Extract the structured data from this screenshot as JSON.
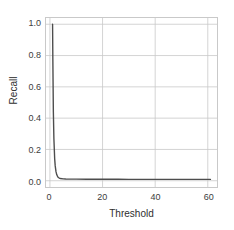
{
  "chart_data": {
    "type": "line",
    "title": "",
    "xlabel": "Threshold",
    "ylabel": "Recall",
    "xlim": [
      -1.5,
      63.5
    ],
    "ylim": [
      -0.04,
      1.04
    ],
    "xticks": [
      0,
      20,
      40,
      60
    ],
    "xtick_labels": [
      "0",
      "20",
      "40",
      "60"
    ],
    "yticks": [
      0.0,
      0.2,
      0.4,
      0.6,
      0.8,
      1.0
    ],
    "ytick_labels": [
      "0.0",
      "0.2",
      "0.4",
      "0.6",
      "0.8",
      "1.0"
    ],
    "grid": true,
    "legend": false,
    "line_color": "#4d4d4d",
    "grid_color": "#c9c9c9",
    "frame_color": "#c9c9c9",
    "series": [
      {
        "name": "Recall",
        "x": [
          1.0,
          1.1,
          1.3,
          1.5,
          1.8,
          2.0,
          2.3,
          2.6,
          3.0,
          3.5,
          4.0,
          5.0,
          6.0,
          8.0,
          10.0,
          14.0,
          18.0,
          22.0,
          26.0,
          30.0,
          35.0,
          40.0,
          45.0,
          50.0,
          55.0,
          60.0,
          61.0
        ],
        "y": [
          1.0,
          0.78,
          0.44,
          0.27,
          0.14,
          0.095,
          0.058,
          0.038,
          0.024,
          0.017,
          0.014,
          0.012,
          0.011,
          0.0105,
          0.01,
          0.0098,
          0.0096,
          0.0094,
          0.0092,
          0.0091,
          0.009,
          0.0089,
          0.0088,
          0.0087,
          0.0086,
          0.0085,
          0.0085
        ]
      }
    ]
  }
}
